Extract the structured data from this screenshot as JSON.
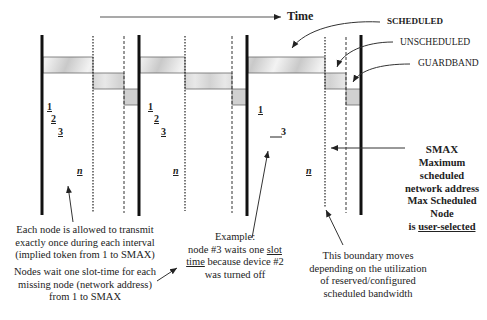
{
  "title": {
    "time_label": "Time"
  },
  "legend": {
    "scheduled": "SCHEDULED",
    "unscheduled": "UNSCHEDULED",
    "guardband": "GUARDBAND"
  },
  "intervals": [
    {
      "start_x": 42,
      "dotted_x": 93,
      "dashed_x": 124,
      "end_x": 139,
      "nodes": [
        {
          "label": "1",
          "x": 47,
          "y": 101
        },
        {
          "label": "2",
          "x": 51,
          "y": 113
        },
        {
          "label": "3",
          "x": 58,
          "y": 126
        },
        {
          "label": "n",
          "x": 77,
          "y": 165
        }
      ]
    },
    {
      "start_x": 139,
      "dotted_x": 185,
      "dashed_x": 232,
      "end_x": 247,
      "nodes": [
        {
          "label": "1",
          "x": 148,
          "y": 101
        },
        {
          "label": "2",
          "x": 154,
          "y": 113
        },
        {
          "label": "3",
          "x": 161,
          "y": 126
        },
        {
          "label": "n",
          "x": 173,
          "y": 165
        }
      ]
    },
    {
      "start_x": 247,
      "dotted_x": 325,
      "dashed_x": 346,
      "end_x": 361,
      "nodes": [
        {
          "label": "1",
          "x": 258,
          "y": 107
        },
        {
          "label": "3",
          "x": 281,
          "y": 128
        },
        {
          "label": "n",
          "x": 306,
          "y": 165
        }
      ]
    }
  ],
  "smax": {
    "title": "SMAX",
    "line1": "Maximum scheduled",
    "line2": "network address",
    "line3": "Max Scheduled Node",
    "line4_prefix": "is ",
    "line4_underlined": "user-selected"
  },
  "notes": {
    "each_node": [
      "Each node is allowed to transmit",
      "exactly once during each interval",
      "(implied token from 1 to SMAX)"
    ],
    "nodes_wait": [
      "Nodes wait one slot-time for each",
      "missing node (network address)",
      "from 1 to SMAX"
    ],
    "example": {
      "line1": "Example:",
      "line2_prefix": "node #3 waits one ",
      "line2_underlined": "slot",
      "line3_underlined": "time",
      "line3_suffix": " because device #2",
      "line4": "was turned off"
    },
    "boundary": [
      "This boundary  moves",
      "depending on the utilization",
      "of reserved/configured",
      "scheduled bandwidth"
    ]
  },
  "colors": {
    "line": "#111111",
    "band_fill": "#d4d4d4",
    "band_stroke": "#6a6a6a",
    "text": "#222222"
  }
}
